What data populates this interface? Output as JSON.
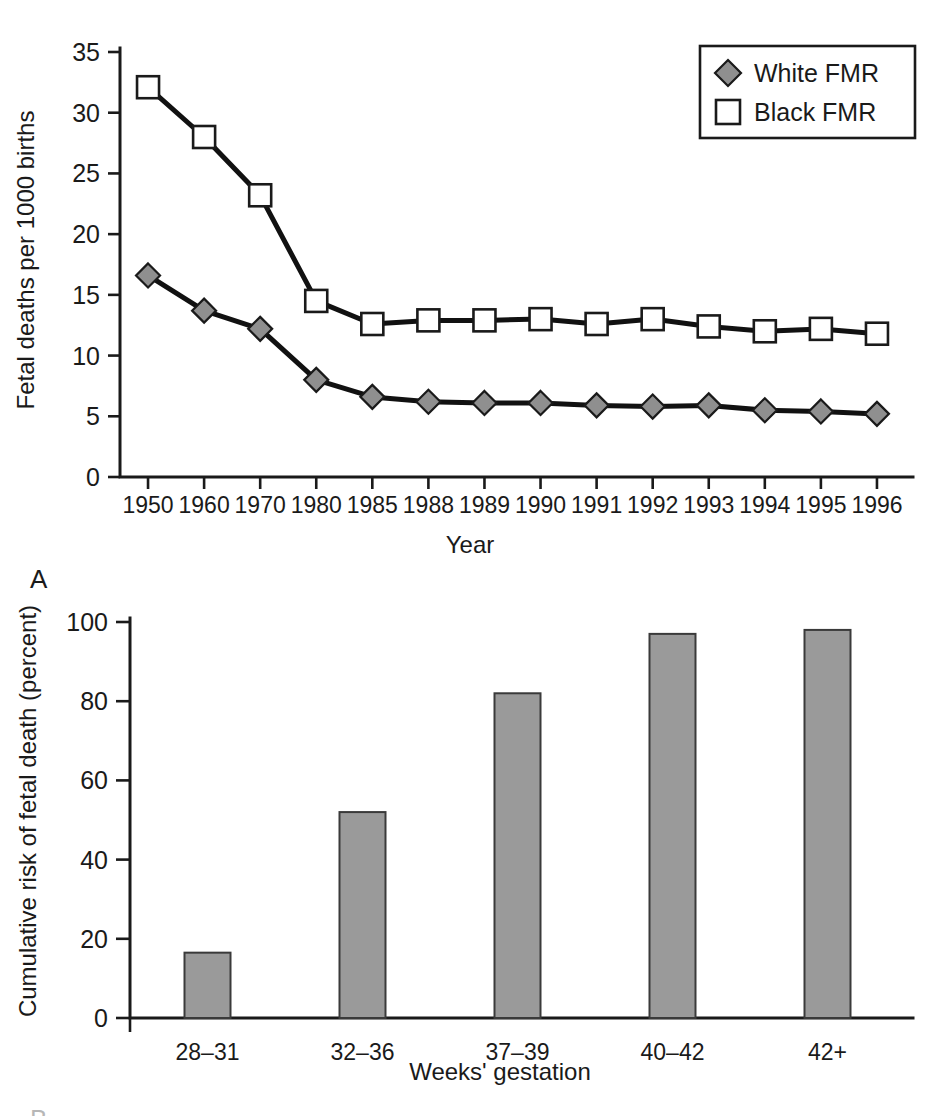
{
  "figure": {
    "panel_a_label": "A",
    "panel_b_label": "B",
    "cropped_top_text": "",
    "colors": {
      "white_fmr_marker": "#8f8f8f",
      "black_fmr_marker": "#ffffff",
      "line": "#111111",
      "bar_fill": "#9a9a9a",
      "bar_stroke": "#3a3a3a",
      "axis": "#1a1a1a",
      "background": "#ffffff"
    }
  },
  "chart_data": [
    {
      "type": "line",
      "title": "",
      "xlabel": "Year",
      "ylabel": "Fetal deaths per 1000 births",
      "categories": [
        "1950",
        "1960",
        "1970",
        "1980",
        "1985",
        "1988",
        "1989",
        "1990",
        "1991",
        "1992",
        "1993",
        "1994",
        "1995",
        "1996"
      ],
      "ylim": [
        0,
        35
      ],
      "yticks": [
        0,
        5,
        10,
        15,
        20,
        25,
        30,
        35
      ],
      "grid": false,
      "legend_position": "top-right",
      "series": [
        {
          "name": "White FMR",
          "marker": "diamond",
          "marker_fill": "#8f8f8f",
          "values": [
            16.6,
            13.7,
            12.2,
            8.0,
            6.6,
            6.2,
            6.1,
            6.1,
            5.9,
            5.8,
            5.9,
            5.5,
            5.4,
            5.2
          ]
        },
        {
          "name": "Black FMR",
          "marker": "square",
          "marker_fill": "#ffffff",
          "values": [
            32.1,
            28.0,
            23.2,
            14.5,
            12.6,
            12.9,
            12.9,
            13.0,
            12.6,
            13.0,
            12.4,
            12.0,
            12.2,
            11.8
          ]
        }
      ]
    },
    {
      "type": "bar",
      "title": "",
      "xlabel": "Weeks' gestation",
      "ylabel": "Cumulative risk of fetal death (percent)",
      "categories": [
        "28–31",
        "32–36",
        "37–39",
        "40–42",
        "42+"
      ],
      "values": [
        16.5,
        52.0,
        82.0,
        97.0,
        98.0
      ],
      "ylim": [
        0,
        100
      ],
      "yticks": [
        0,
        20,
        40,
        60,
        80,
        100
      ],
      "grid": false,
      "bar_fill": "#9a9a9a"
    }
  ]
}
